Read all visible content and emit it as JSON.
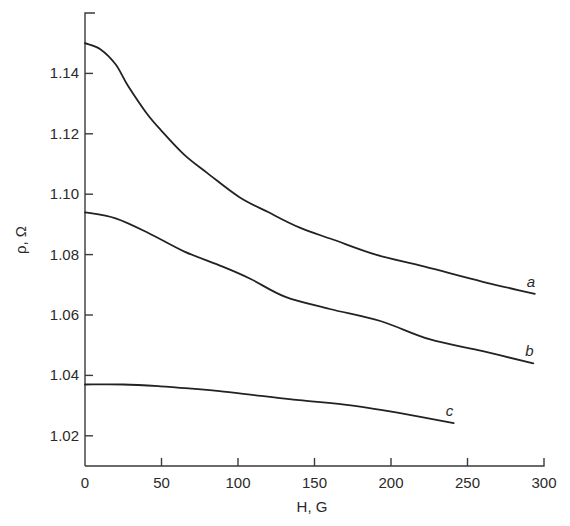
{
  "chart_data": {
    "type": "line",
    "title": "",
    "xlabel": "H, G",
    "ylabel": "ρ, Ω",
    "xlim": [
      0,
      300
    ],
    "ylim": [
      1.01,
      1.16
    ],
    "grid": false,
    "legend": "inline curve labels at right end of each curve",
    "x_ticks": [
      0,
      50,
      100,
      150,
      200,
      250,
      300
    ],
    "x_tick_labels": [
      "0",
      "50",
      "100",
      "150",
      "200",
      "250",
      "300"
    ],
    "y_ticks": [
      1.02,
      1.04,
      1.06,
      1.08,
      1.1,
      1.12,
      1.14
    ],
    "y_tick_labels": [
      "1.02",
      "1.04",
      "1.06",
      "1.08",
      "1.10",
      "1.12",
      "1.14"
    ],
    "series": [
      {
        "name": "a",
        "x": [
          0,
          10,
          20,
          28,
          40,
          50,
          65,
          80,
          101,
          120,
          140,
          162,
          190,
          222,
          260,
          294
        ],
        "values": [
          1.15,
          1.148,
          1.143,
          1.136,
          1.127,
          1.121,
          1.113,
          1.107,
          1.099,
          1.094,
          1.089,
          1.085,
          1.08,
          1.076,
          1.071,
          1.067
        ]
      },
      {
        "name": "b",
        "x": [
          0,
          20,
          42,
          65,
          90,
          108,
          131,
          160,
          193,
          225,
          260,
          293
        ],
        "values": [
          1.094,
          1.092,
          1.087,
          1.081,
          1.076,
          1.072,
          1.066,
          1.062,
          1.058,
          1.052,
          1.048,
          1.044
        ]
      },
      {
        "name": "c",
        "x": [
          0,
          25,
          49,
          70,
          88,
          115,
          140,
          175,
          206,
          241
        ],
        "values": [
          1.037,
          1.037,
          1.0364,
          1.0356,
          1.0348,
          1.0332,
          1.0318,
          1.03,
          1.0275,
          1.0242
        ]
      }
    ]
  }
}
